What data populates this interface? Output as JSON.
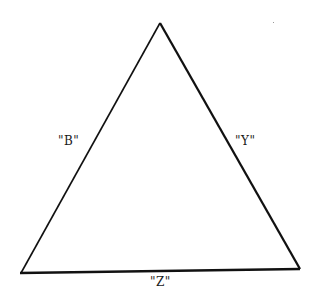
{
  "diagram": {
    "shape": "triangle",
    "vertices": {
      "apex": [
        160,
        23
      ],
      "bottom_left": [
        20,
        273
      ],
      "bottom_right": [
        300,
        269
      ]
    },
    "stroke_color": "#111111",
    "labels": {
      "left_side": "\"B\"",
      "right_side": "\"Y\"",
      "bottom_side": "\"Z\""
    }
  }
}
